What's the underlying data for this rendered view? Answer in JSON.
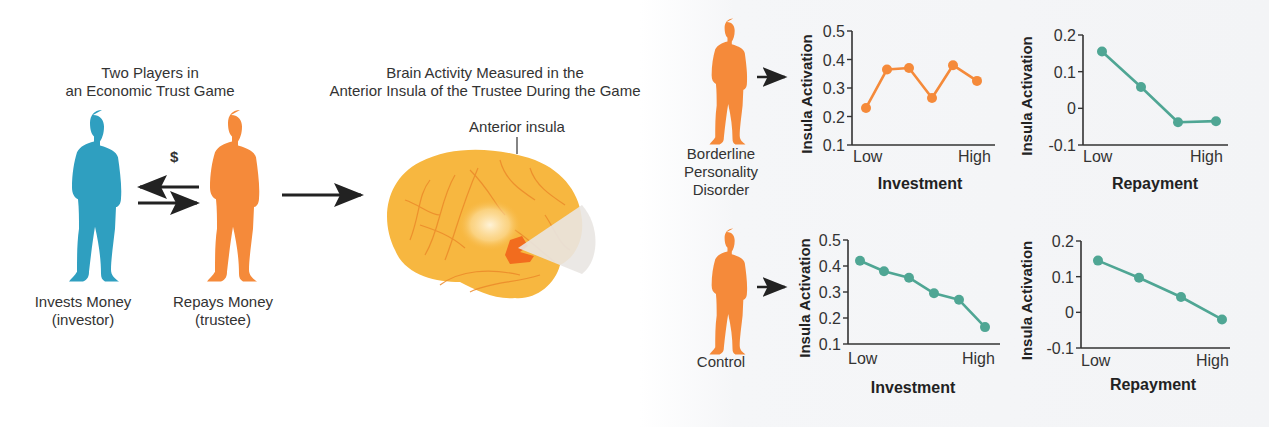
{
  "left_section": {
    "title_line1": "Two Players in",
    "title_line2": "an Economic Trust Game",
    "dollar_sign": "$",
    "investor": {
      "label_line1": "Invests Money",
      "label_line2": "(investor)",
      "color": "#2f9fc0",
      "icon": "person-silhouette-icon"
    },
    "trustee": {
      "label_line1": "Repays Money",
      "label_line2": "(trustee)",
      "color": "#f58a3a",
      "icon": "person-silhouette-icon"
    },
    "arrows": [
      "arrow-left",
      "arrow-right"
    ]
  },
  "middle_section": {
    "title_line1": "Brain Activity Measured in the",
    "title_line2": "Anterior Insula of the Trustee During the Game",
    "brain_label": "Anterior insula",
    "brain_color": "#f7b740",
    "insula_color": "#f26c1e"
  },
  "right_section": {
    "groups": [
      {
        "label_lines": [
          "Borderline",
          "Personality",
          "Disorder"
        ],
        "figure_color": "#f58a3a"
      },
      {
        "label_lines": [
          "Control"
        ],
        "figure_color": "#f58a3a"
      }
    ]
  },
  "colors": {
    "orange": "#f58a3a",
    "teal": "#4fa694",
    "axis": "#333333"
  },
  "chart_data": [
    {
      "type": "line",
      "title": "Borderline Personality Disorder – Investment",
      "xlabel": "Investment",
      "ylabel": "Insula Activation",
      "x_tick_labels": [
        "Low",
        "High"
      ],
      "x": [
        1,
        2,
        3,
        4,
        5,
        6
      ],
      "values": [
        0.23,
        0.365,
        0.37,
        0.265,
        0.38,
        0.325
      ],
      "yticks": [
        "0.1",
        "0.2",
        "0.3",
        "0.4",
        "0.5"
      ],
      "ylim": [
        0.1,
        0.5
      ],
      "color": "#f58a3a",
      "grid": false
    },
    {
      "type": "line",
      "title": "Borderline Personality Disorder – Repayment",
      "xlabel": "Repayment",
      "ylabel": "Insula Activation",
      "x_tick_labels": [
        "Low",
        "High"
      ],
      "x": [
        1,
        2,
        3,
        4
      ],
      "values": [
        0.155,
        0.058,
        -0.038,
        -0.035
      ],
      "yticks": [
        "-0.1",
        "0",
        "0.1",
        "0.2"
      ],
      "ylim": [
        -0.1,
        0.2
      ],
      "color": "#4fa694",
      "grid": false
    },
    {
      "type": "line",
      "title": "Control – Investment",
      "xlabel": "Investment",
      "ylabel": "Insula Activation",
      "x_tick_labels": [
        "Low",
        "High"
      ],
      "x": [
        1,
        2,
        3,
        4,
        5,
        6
      ],
      "values": [
        0.42,
        0.38,
        0.355,
        0.295,
        0.27,
        0.165
      ],
      "yticks": [
        "0.1",
        "0.2",
        "0.3",
        "0.4",
        "0.5"
      ],
      "ylim": [
        0.1,
        0.5
      ],
      "color": "#4fa694",
      "grid": false
    },
    {
      "type": "line",
      "title": "Control – Repayment",
      "xlabel": "Repayment",
      "ylabel": "Insula Activation",
      "x_tick_labels": [
        "Low",
        "High"
      ],
      "x": [
        1,
        2,
        3,
        4
      ],
      "values": [
        0.145,
        0.097,
        0.043,
        -0.02
      ],
      "yticks": [
        "-0.1",
        "0",
        "0.1",
        "0.2"
      ],
      "ylim": [
        -0.1,
        0.2
      ],
      "color": "#4fa694",
      "grid": false
    }
  ]
}
